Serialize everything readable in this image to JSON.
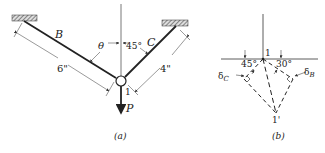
{
  "figure_a": {
    "caption": "(a)",
    "bar_b_label": "B",
    "bar_c_label": "C",
    "angle_theta": "θ",
    "angle_c": "45°",
    "length_b": "6\"",
    "length_c": "4\"",
    "node_label": "1",
    "load_label": "P"
  },
  "figure_b": {
    "caption": "(b)",
    "node_label": "1",
    "displaced_node_label": "1'",
    "angle_left": "45°",
    "angle_right": "30°",
    "delta_c": "δ",
    "delta_c_sub": "C",
    "delta_b": "δ",
    "delta_b_sub": "B"
  },
  "colors": {
    "line": "#222222",
    "hatch": "#555555",
    "dim": "#444444"
  }
}
